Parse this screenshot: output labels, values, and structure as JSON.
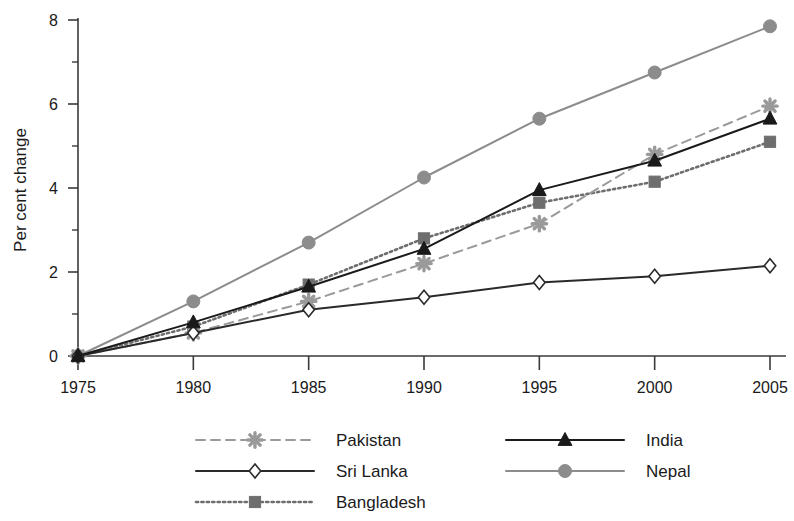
{
  "chart_data": {
    "type": "line",
    "title": "",
    "subtitle": "",
    "xlabel": "",
    "ylabel": "Per cent change",
    "x": [
      1975,
      1980,
      1985,
      1990,
      1995,
      2000,
      2005
    ],
    "xtick_labels": [
      "1975",
      "1980",
      "1985",
      "1990",
      "1995",
      "2000",
      "2005"
    ],
    "ytick_labels": [
      "0",
      "2",
      "4",
      "6",
      "8"
    ],
    "ytick_values": [
      0,
      2,
      4,
      6,
      8
    ],
    "yminor_values": [
      1,
      3,
      5,
      7
    ],
    "xlim": [
      1975,
      2005
    ],
    "ylim": [
      0,
      8
    ],
    "grid": false,
    "legend_position": "bottom",
    "series": [
      {
        "name": "Pakistan",
        "values": [
          0,
          0.55,
          1.3,
          2.2,
          3.15,
          4.8,
          5.95
        ],
        "color": "#9a9a9a",
        "line_style": "dashed",
        "marker": "asterisk-marker"
      },
      {
        "name": "India",
        "values": [
          0,
          0.8,
          1.65,
          2.55,
          3.95,
          4.65,
          5.65
        ],
        "color": "#1a1a1a",
        "line_style": "solid",
        "marker": "triangle-marker"
      },
      {
        "name": "Sri Lanka",
        "values": [
          0,
          0.55,
          1.1,
          1.4,
          1.75,
          1.9,
          2.15
        ],
        "color": "#2a2a2a",
        "line_style": "solid",
        "marker": "diamond-marker"
      },
      {
        "name": "Nepal",
        "values": [
          0,
          1.3,
          2.7,
          4.25,
          5.65,
          6.75,
          7.85
        ],
        "color": "#8c8c8c",
        "line_style": "solid",
        "marker": "circle-marker"
      },
      {
        "name": "Bangladesh",
        "values": [
          0,
          0.7,
          1.7,
          2.8,
          3.65,
          4.15,
          5.1
        ],
        "color": "#6e6e6e",
        "line_style": "dotted",
        "marker": "square-marker"
      }
    ]
  },
  "legend": {
    "entries": [
      {
        "label": "Pakistan"
      },
      {
        "label": "India"
      },
      {
        "label": "Sri Lanka"
      },
      {
        "label": "Nepal"
      },
      {
        "label": "Bangladesh"
      }
    ]
  },
  "axes": {
    "y_title": "Per cent change"
  }
}
